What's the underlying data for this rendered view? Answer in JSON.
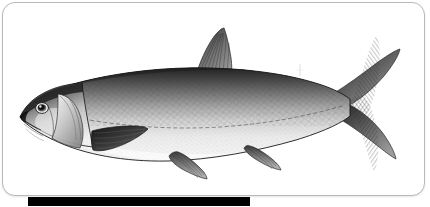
{
  "page": {
    "background_color": "#ffffff"
  },
  "frame": {
    "name": "rounded-card-frame",
    "border_color": "#b9b9bd",
    "fill_color": "#ffffff",
    "corner_radius": 13
  },
  "illustration": {
    "subject": "fish",
    "common_description": "side-view scientific engraving of a silvery scaled fish",
    "style": "grayscale stipple-and-line engraving",
    "orientation": "facing left",
    "palette": {
      "dorsal_dark": "#2b2b2b",
      "mid_gray": "#8d8d8d",
      "scale_gray": "#b4b4b4",
      "ventral_light": "#f2f2f2",
      "fin_dark": "#3a3a3a",
      "outline": "#1d1d1d",
      "eye_dark": "#101010",
      "eye_light": "#d8d8d8"
    },
    "parts": [
      {
        "name": "snout",
        "label": "Snout"
      },
      {
        "name": "eye",
        "label": "Eye"
      },
      {
        "name": "operculum",
        "label": "Gill cover"
      },
      {
        "name": "dorsal-fin",
        "label": "Dorsal fin"
      },
      {
        "name": "pectoral-fin",
        "label": "Pectoral fin"
      },
      {
        "name": "pelvic-fin",
        "label": "Pelvic fin"
      },
      {
        "name": "anal-fin",
        "label": "Anal fin"
      },
      {
        "name": "caudal-fin",
        "label": "Caudal fin"
      },
      {
        "name": "lateral-line",
        "label": "Lateral line"
      },
      {
        "name": "scales",
        "label": "Scale pattern"
      }
    ]
  },
  "caption_bar": {
    "name": "caption-bar",
    "color": "#010101",
    "left": 28,
    "top": 197,
    "width": 222,
    "height": 9
  }
}
